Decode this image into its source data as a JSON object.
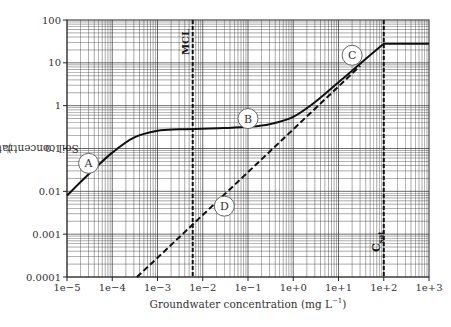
{
  "chart_data": {
    "type": "line",
    "title": "",
    "xlabel": "Groundwater concentration (mg L⁻¹)",
    "ylabel": "Soil concentration (mg kg⁻¹)",
    "xscale": "log",
    "yscale": "log",
    "xlim": [
      1e-05,
      1000.0
    ],
    "ylim": [
      0.0001,
      100
    ],
    "grid": true,
    "x_tick_labels": [
      "1e−5",
      "1e−4",
      "1e−3",
      "1e−2",
      "1e−1",
      "1e+0",
      "1e+1",
      "1e+2",
      "1e+3"
    ],
    "y_tick_labels": [
      "0.0001",
      "0.001",
      "0.01",
      "0.1",
      "1",
      "10",
      "100"
    ],
    "series": [
      {
        "name": "Partitioning curve (A-B-C)",
        "style": "solid",
        "x": [
          1e-05,
          3e-05,
          0.0001,
          0.0003,
          0.001,
          0.003,
          0.01,
          0.03,
          0.1,
          0.3,
          1,
          3,
          10,
          30,
          100,
          1000
        ],
        "y": [
          0.008,
          0.025,
          0.08,
          0.18,
          0.26,
          0.28,
          0.29,
          0.3,
          0.32,
          0.37,
          0.55,
          1.2,
          3.5,
          9.5,
          28,
          28
        ]
      },
      {
        "name": "Linear partitioning (D)",
        "style": "dashed",
        "x": [
          0.00035,
          0.001,
          0.01,
          0.1,
          1,
          10,
          30
        ],
        "y": [
          0.0001,
          0.00028,
          0.0028,
          0.028,
          0.28,
          2.8,
          8.5
        ]
      }
    ],
    "vertical_lines": [
      {
        "label": "MCL",
        "x": 0.006,
        "style": "dashed"
      },
      {
        "label": "Csat",
        "x": 100,
        "style": "dashed"
      }
    ],
    "annotations": [
      {
        "label": "A",
        "x": 3e-05,
        "y": 0.045
      },
      {
        "label": "B",
        "x": 0.1,
        "y": 0.5
      },
      {
        "label": "C",
        "x": 20,
        "y": 15
      },
      {
        "label": "D",
        "x": 0.03,
        "y": 0.0045
      }
    ]
  },
  "labels": {
    "ylabel_text": "Soil concentration (mg kg",
    "ylabel_sup": "−1",
    "ylabel_end": ")",
    "xlabel_text": "Groundwater concentration (mg L",
    "xlabel_sup": "−1",
    "xlabel_end": ")"
  }
}
